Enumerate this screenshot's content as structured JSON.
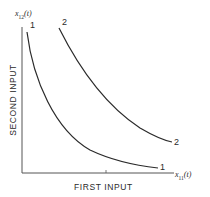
{
  "diagram": {
    "type": "isoquant-curves",
    "y_axis": {
      "title": "SECOND INPUT",
      "variable": "x",
      "variable_sub": "12",
      "variable_arg": "(t)"
    },
    "x_axis": {
      "title": "FIRST INPUT",
      "variable": "x",
      "variable_sub": "11",
      "variable_arg": "(t)"
    },
    "curves": [
      {
        "id": "1",
        "label_start": "1",
        "label_end": "1"
      },
      {
        "id": "2",
        "label_start": "2",
        "label_end": "2"
      }
    ],
    "colors": {
      "line": "#2a2a2a",
      "axis": "#555555",
      "background": "#ffffff"
    }
  }
}
